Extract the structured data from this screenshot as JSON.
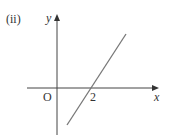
{
  "figure": {
    "label": "(ii)",
    "axes": {
      "x_label": "x",
      "y_label": "y",
      "origin_label": "O",
      "x_intercept_label": "2"
    },
    "line": {
      "description": "straight line with positive gradient crossing x-axis at x = 2",
      "x_intercept": 2
    },
    "colors": {
      "axis": "#333333",
      "line": "#777777",
      "text": "#333333"
    }
  }
}
